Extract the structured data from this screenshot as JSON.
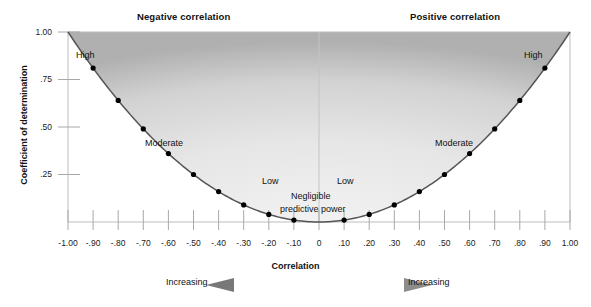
{
  "headers": {
    "negative": "Negative correlation",
    "positive": "Positive correlation"
  },
  "axes": {
    "ylabel": "Coefficient of determination",
    "xlabel": "Correlation"
  },
  "footer": {
    "left_label": "Increasing",
    "right_label": "Increasing"
  },
  "zone_labels": {
    "high_left": "High",
    "moderate_left": "Moderate",
    "low_left": "Low",
    "negligible_line1": "Negligible",
    "negligible_line2": "predictive power",
    "low_right": "Low",
    "moderate_right": "Moderate",
    "high_right": "High"
  },
  "colors": {
    "shade_light": "#e8e8e8",
    "shade_dark": "#b4b4b4",
    "curve": "#4a4a4a",
    "axis": "#9a9a9a",
    "point": "#000000",
    "text": "#111111"
  },
  "chart_data": {
    "type": "line",
    "xlabel": "Correlation",
    "ylabel": "Coefficient of determination",
    "xlim": [
      -1.0,
      1.0
    ],
    "ylim": [
      0.0,
      1.0
    ],
    "grid": false,
    "legend": "none",
    "xticks": [
      "-1.00",
      "-.90",
      "-.80",
      "-.70",
      "-.60",
      "-.50",
      "-.40",
      "-.30",
      "-.20",
      "-.10",
      "0",
      ".10",
      ".20",
      ".30",
      ".40",
      ".50",
      ".60",
      ".70",
      ".80",
      ".90",
      "1.00"
    ],
    "xtick_values": [
      -1.0,
      -0.9,
      -0.8,
      -0.7,
      -0.6,
      -0.5,
      -0.4,
      -0.3,
      -0.2,
      -0.1,
      0.0,
      0.1,
      0.2,
      0.3,
      0.4,
      0.5,
      0.6,
      0.7,
      0.8,
      0.9,
      1.0
    ],
    "yticks": [
      "1.00",
      ".75",
      ".50",
      ".25"
    ],
    "ytick_values": [
      1.0,
      0.75,
      0.5,
      0.25
    ],
    "series": [
      {
        "name": "r squared",
        "x": [
          -1.0,
          -0.9,
          -0.8,
          -0.7,
          -0.6,
          -0.5,
          -0.4,
          -0.3,
          -0.2,
          -0.1,
          0.0,
          0.1,
          0.2,
          0.3,
          0.4,
          0.5,
          0.6,
          0.7,
          0.8,
          0.9,
          1.0
        ],
        "values": [
          1.0,
          0.81,
          0.64,
          0.49,
          0.36,
          0.25,
          0.16,
          0.09,
          0.04,
          0.01,
          0.0,
          0.01,
          0.04,
          0.09,
          0.16,
          0.25,
          0.36,
          0.49,
          0.64,
          0.81,
          1.0
        ],
        "marker": "filled-circle",
        "markers_at": [
          -0.9,
          -0.8,
          -0.7,
          -0.6,
          -0.5,
          -0.4,
          -0.3,
          -0.2,
          -0.1,
          0.1,
          0.2,
          0.3,
          0.4,
          0.5,
          0.6,
          0.7,
          0.8,
          0.9
        ]
      }
    ],
    "annotations": [
      {
        "text": "High",
        "x": -0.87,
        "y": 0.9
      },
      {
        "text": "Moderate",
        "x": -0.6,
        "y": 0.47
      },
      {
        "text": "Low",
        "x": -0.17,
        "y": 0.2
      },
      {
        "text": "Negligible",
        "x": -0.02,
        "y": 0.14
      },
      {
        "text": "predictive power",
        "x": -0.02,
        "y": 0.08
      },
      {
        "text": "Low",
        "x": 0.1,
        "y": 0.2
      },
      {
        "text": "Moderate",
        "x": 0.57,
        "y": 0.47
      },
      {
        "text": "High",
        "x": 0.87,
        "y": 0.9
      }
    ],
    "shaded_region": "area above the parabola y = x^2, gradient from dark gray at the curve to light gray in the interior"
  }
}
